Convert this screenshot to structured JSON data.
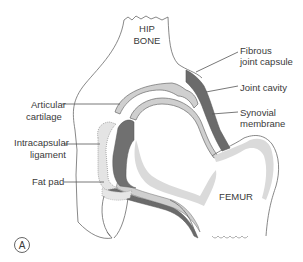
{
  "figure": {
    "panel_label": "A"
  },
  "structures": {
    "hip_bone": {
      "line1": "HIP",
      "line2": "BONE"
    },
    "femur": {
      "label": "FEMUR"
    }
  },
  "labels": {
    "fibrous_capsule": {
      "line1": "Fibrous",
      "line2": "joint capsule"
    },
    "joint_cavity": {
      "line1": "Joint cavity"
    },
    "synovial_membrane": {
      "line1": "Synovial",
      "line2": "membrane"
    },
    "articular_cartilage": {
      "line1": "Articular",
      "line2": "cartilage"
    },
    "intracapsular_ligament": {
      "line1": "Intracapsular",
      "line2": "ligament"
    },
    "fat_pad": {
      "line1": "Fat pad"
    }
  },
  "colors": {
    "capsule_dark": "#6b6b6b",
    "cartilage_light": "#cfcfcf",
    "marrow_light": "#dadada",
    "outline": "#6a6a6a",
    "text": "#3a3a3a"
  }
}
